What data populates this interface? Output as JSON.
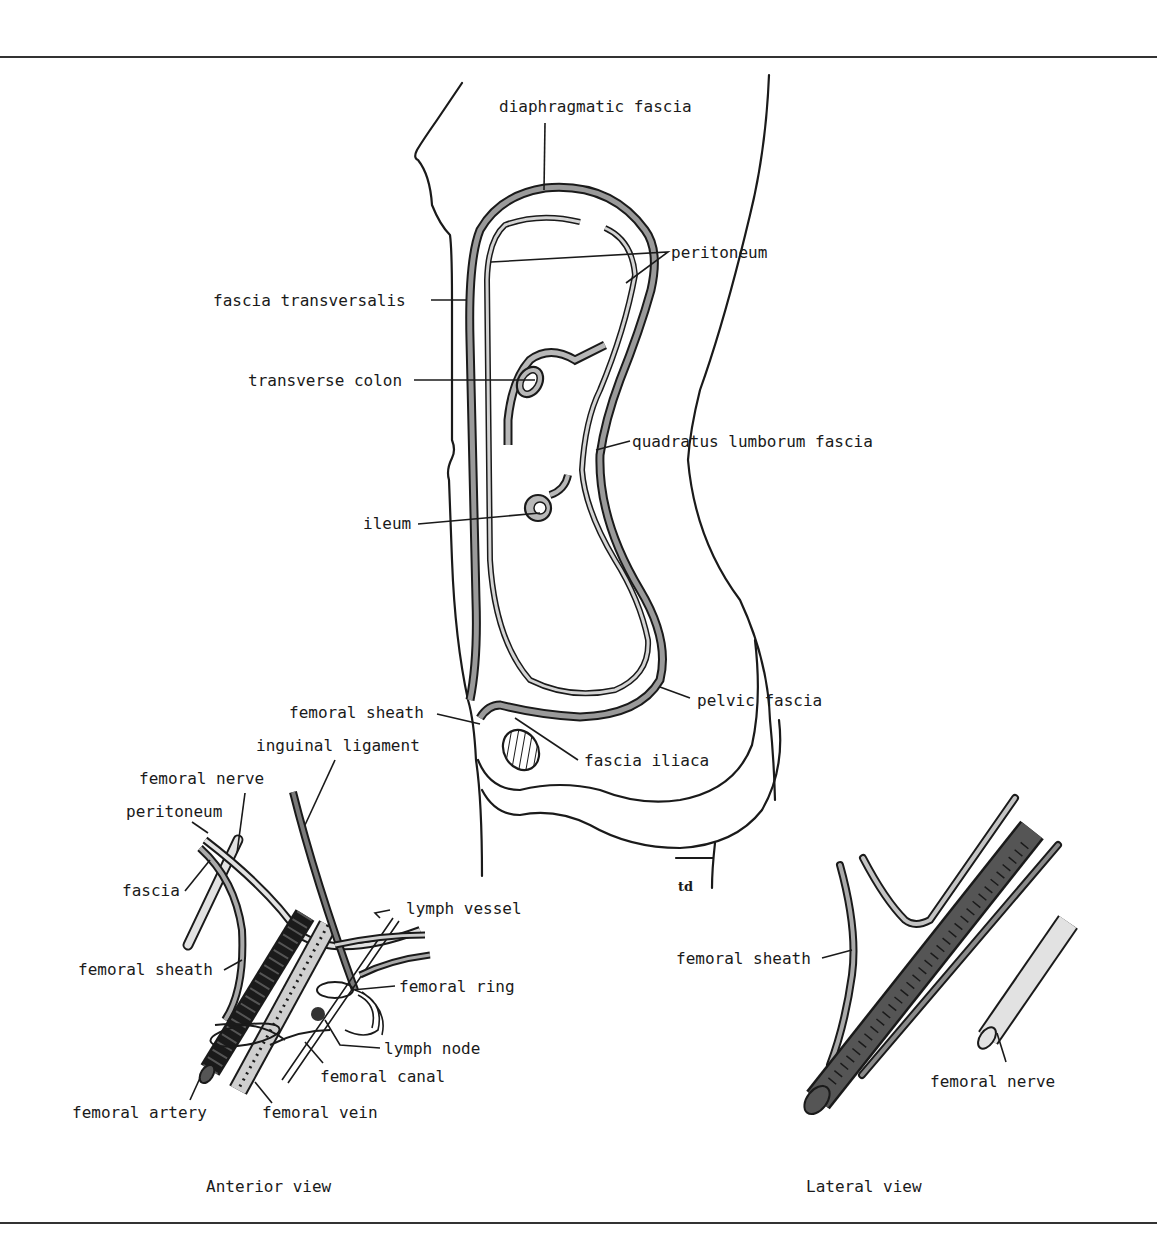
{
  "figure": {
    "rules": {
      "top_y": 57,
      "bottom_y": 1223
    },
    "colors": {
      "ink": "#1a1a1a",
      "fascia_gray": "#9a9a9a",
      "light_gray": "#d4d4d4",
      "dark_vessel": "#555555",
      "background": "#ffffff"
    },
    "signature": "td",
    "main_section": {
      "labels": {
        "diaphragmatic_fascia": "diaphragmatic fascia",
        "peritoneum": "peritoneum",
        "fascia_transversalis": "fascia transversalis",
        "transverse_colon": "transverse colon",
        "quadratus_lumborum_fascia": "quadratus lumborum fascia",
        "ileum": "ileum",
        "pelvic_fascia": "pelvic fascia",
        "femoral_sheath": "femoral sheath",
        "fascia_iliaca": "fascia iliaca"
      }
    },
    "anterior_view": {
      "caption": "Anterior view",
      "labels": {
        "inguinal_ligament": "inguinal ligament",
        "femoral_nerve": "femoral nerve",
        "peritoneum": "peritoneum",
        "fascia": "fascia",
        "femoral_sheath": "femoral sheath",
        "lymph_vessel": "lymph vessel",
        "femoral_ring": "femoral ring",
        "lymph_node": "lymph node",
        "femoral_canal": "femoral canal",
        "femoral_artery": "femoral artery",
        "femoral_vein": "femoral vein"
      }
    },
    "lateral_view": {
      "caption": "Lateral view",
      "labels": {
        "femoral_sheath": "femoral sheath",
        "femoral_nerve": "femoral nerve"
      }
    }
  }
}
